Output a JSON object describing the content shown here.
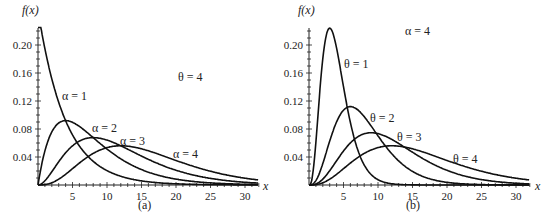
{
  "chart_data": [
    {
      "type": "line",
      "panel": "(a)",
      "title": "Gamma densities, theta fixed",
      "fixed_param_label": "θ = 4",
      "xlabel": "x",
      "ylabel": "f(x)",
      "xlim": [
        0,
        32
      ],
      "ylim": [
        0,
        0.22
      ],
      "xticks": [
        5,
        10,
        15,
        20,
        25,
        30
      ],
      "yticks": [
        0.04,
        0.08,
        0.12,
        0.16,
        0.2
      ],
      "ytick_labels": [
        "0.04",
        "0.08",
        "0.12",
        "0.16",
        "0.20"
      ],
      "theta": 4,
      "series": [
        {
          "name": "α = 1",
          "alpha": 1,
          "theta": 4
        },
        {
          "name": "α = 2",
          "alpha": 2,
          "theta": 4
        },
        {
          "name": "α = 3",
          "alpha": 3,
          "theta": 4
        },
        {
          "name": "α = 4",
          "alpha": 4,
          "theta": 4
        }
      ]
    },
    {
      "type": "line",
      "panel": "(b)",
      "title": "Gamma densities, alpha fixed",
      "fixed_param_label": "α = 4",
      "xlabel": "x",
      "ylabel": "f(x)",
      "xlim": [
        0,
        32
      ],
      "ylim": [
        0,
        0.22
      ],
      "xticks": [
        5,
        10,
        15,
        20,
        25,
        30
      ],
      "yticks": [
        0.04,
        0.08,
        0.12,
        0.16,
        0.2
      ],
      "ytick_labels": [
        "0.04",
        "0.08",
        "0.12",
        "0.16",
        "0.20"
      ],
      "alpha": 4,
      "series": [
        {
          "name": "θ = 1",
          "alpha": 4,
          "theta": 1
        },
        {
          "name": "θ = 2",
          "alpha": 4,
          "theta": 2
        },
        {
          "name": "θ = 3",
          "alpha": 4,
          "theta": 3
        },
        {
          "name": "θ = 4",
          "alpha": 4,
          "theta": 4
        }
      ]
    }
  ],
  "panels": {
    "a": {
      "caption": "(a)",
      "fixed": "θ = 4",
      "ylabel": "f(x)",
      "xlabel": "x",
      "curve_labels": [
        "α = 1",
        "α = 2",
        "α = 3",
        "α = 4"
      ]
    },
    "b": {
      "caption": "(b)",
      "fixed": "α = 4",
      "ylabel": "f(x)",
      "xlabel": "x",
      "curve_labels": [
        "θ = 1",
        "θ = 2",
        "θ = 3",
        "θ = 4"
      ]
    }
  }
}
